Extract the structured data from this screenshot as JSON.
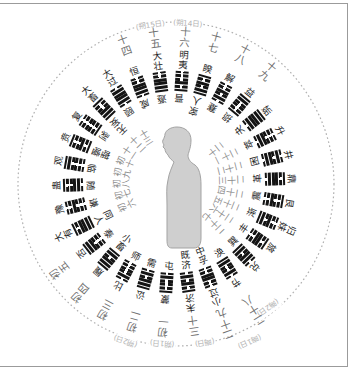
{
  "diagram": {
    "center_figure": "human-figure-profile-facing-left",
    "colors": {
      "glyph": "#141414",
      "hexagram_name": "#262626",
      "day_label": "#707070",
      "moon_label": "#b3b3b3",
      "figure_fill": "#cfcfcf",
      "figure_stroke": "#a3a3a3",
      "dashed_circle": "#b0b0b0",
      "frame": "#9b9b9b"
    },
    "moon_labels": {
      "top": [
        "(朔15日)",
        "(朔14日)"
      ],
      "bottom": [
        "(朔2日)",
        "(朔1日)",
        "(晦日)",
        "(晦1日)",
        "(晦2日)"
      ]
    },
    "ring": {
      "positions": [
        {
          "day": "初一",
          "inner": "屯",
          "outer": "蒙",
          "lines": "010001",
          "day_side": "outer"
        },
        {
          "day": "初二",
          "inner": "需",
          "outer": "讼",
          "lines": "010111",
          "day_side": "outer"
        },
        {
          "day": "初三",
          "inner": "师",
          "outer": "比",
          "lines": "000010",
          "day_side": "outer"
        },
        {
          "day": "初四",
          "inner": "小畜",
          "outer": "履",
          "lines": "110111",
          "day_side": "outer"
        },
        {
          "day": "初五",
          "inner": "泰",
          "outer": "否",
          "lines": "000111",
          "day_side": "outer"
        },
        {
          "day": "初六",
          "inner": "同人",
          "outer": "大有",
          "lines": "111101",
          "day_side": "inner"
        },
        {
          "day": "初七",
          "inner": "谦",
          "outer": "豫",
          "lines": "000100",
          "day_side": "inner"
        },
        {
          "day": "初八",
          "inner": "随",
          "outer": "蛊",
          "lines": "011001",
          "day_side": "inner"
        },
        {
          "day": "初九",
          "inner": "临",
          "outer": "观",
          "lines": "000011",
          "day_side": "inner"
        },
        {
          "day": "初十",
          "inner": "噬嗑",
          "outer": "贲",
          "lines": "101001",
          "day_side": "inner"
        },
        {
          "day": "十一",
          "inner": "剥",
          "outer": "复",
          "lines": "100000",
          "day_side": "inner"
        },
        {
          "day": "十二",
          "inner": "无妄",
          "outer": "大畜",
          "lines": "111001",
          "day_side": "inner"
        },
        {
          "day": "十三",
          "inner": "颐",
          "outer": "大过",
          "lines": "011110",
          "day_side": "inner"
        },
        {
          "day": "十四",
          "inner": "咸",
          "outer": "恒",
          "lines": "011100",
          "day_side": "outer"
        },
        {
          "day": "十五",
          "inner": "遯",
          "outer": "大壮",
          "lines": "111100",
          "day_side": "outer"
        },
        {
          "day": "十六",
          "inner": "晋",
          "outer": "明夷",
          "lines": "101000",
          "day_side": "outer"
        },
        {
          "day": "十七",
          "inner": "家人",
          "outer": "睽",
          "lines": "110101",
          "day_side": "outer"
        },
        {
          "day": "十八",
          "inner": "蹇",
          "outer": "解",
          "lines": "010100",
          "day_side": "outer"
        },
        {
          "day": "十九",
          "inner": "损",
          "outer": "益",
          "lines": "100011",
          "day_side": "outer"
        },
        {
          "day": "二十",
          "inner": "夬",
          "outer": "姤",
          "lines": "011111",
          "day_side": "inner"
        },
        {
          "day": "二十一",
          "inner": "萃",
          "outer": "升",
          "lines": "011000",
          "day_side": "inner"
        },
        {
          "day": "二十二",
          "inner": "困",
          "outer": "井",
          "lines": "011010",
          "day_side": "inner"
        },
        {
          "day": "二十三",
          "inner": "革",
          "outer": "鼎",
          "lines": "011101",
          "day_side": "inner"
        },
        {
          "day": "二十四",
          "inner": "震",
          "outer": "艮",
          "lines": "001001",
          "day_side": "inner"
        },
        {
          "day": "二十五",
          "inner": "渐",
          "outer": "归妹",
          "lines": "110100",
          "day_side": "inner"
        },
        {
          "day": "二十六",
          "inner": "丰",
          "outer": "旅",
          "lines": "001101",
          "day_side": "inner"
        },
        {
          "day": "二十七",
          "inner": "巽",
          "outer": "兑",
          "lines": "110110",
          "day_side": "inner"
        },
        {
          "day": "二十八",
          "inner": "涣",
          "outer": "节",
          "lines": "110010",
          "day_side": "outer"
        },
        {
          "day": "二十九",
          "inner": "中孚",
          "outer": "小过",
          "lines": "001100",
          "day_side": "outer"
        },
        {
          "day": "三十",
          "inner": "既济",
          "outer": "未济",
          "lines": "010101",
          "day_side": "outer"
        }
      ]
    }
  }
}
